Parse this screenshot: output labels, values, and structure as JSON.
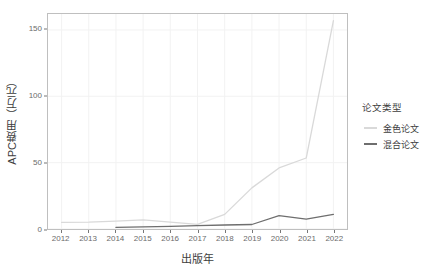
{
  "chart_data": {
    "type": "line",
    "title": "",
    "xlabel": "出版年",
    "ylabel": "APC费用（万元）",
    "x": [
      2012,
      2013,
      2014,
      2015,
      2016,
      2017,
      2018,
      2019,
      2020,
      2021,
      2022
    ],
    "xlim": [
      2011.5,
      2022.5
    ],
    "ylim": [
      0,
      162
    ],
    "yticks": [
      0,
      50,
      100,
      150
    ],
    "ytick_labels": [
      "0",
      "50",
      "100",
      "150"
    ],
    "xtick_labels": [
      "2012",
      "2013",
      "2014",
      "2015",
      "2016",
      "2017",
      "2018",
      "2019",
      "2020",
      "2021",
      "2022"
    ],
    "grid": true,
    "legend_position": "right",
    "legend_title": "论文类型",
    "series": [
      {
        "name": "金色论文",
        "color": "#d9d9d9",
        "x": [
          2012,
          2013,
          2014,
          2015,
          2016,
          2017,
          2018,
          2019,
          2020,
          2021,
          2022
        ],
        "values": [
          5.0,
          5.2,
          6.0,
          6.8,
          5.2,
          3.5,
          11.0,
          31.0,
          46.0,
          53.5,
          157.0
        ]
      },
      {
        "name": "混合论文",
        "color": "#6e6e6e",
        "x": [
          2014,
          2015,
          2016,
          2017,
          2018,
          2019,
          2020,
          2021,
          2022
        ],
        "values": [
          1.2,
          1.6,
          2.0,
          2.6,
          3.0,
          3.4,
          10.0,
          7.5,
          11.0
        ]
      }
    ]
  },
  "axes": {
    "y_title": "APC费用（万元）",
    "x_title": "出版年"
  },
  "legend": {
    "title": "论文类型",
    "items": [
      {
        "label": "金色论文",
        "color": "#d9d9d9"
      },
      {
        "label": "混合论文",
        "color": "#6e6e6e"
      }
    ]
  },
  "colors": {
    "panel_border": "#bfbfbf",
    "grid": "#f2f2f2",
    "tick_text": "#6b6b6b",
    "title_text": "#3d3d3d",
    "background": "#ffffff"
  }
}
